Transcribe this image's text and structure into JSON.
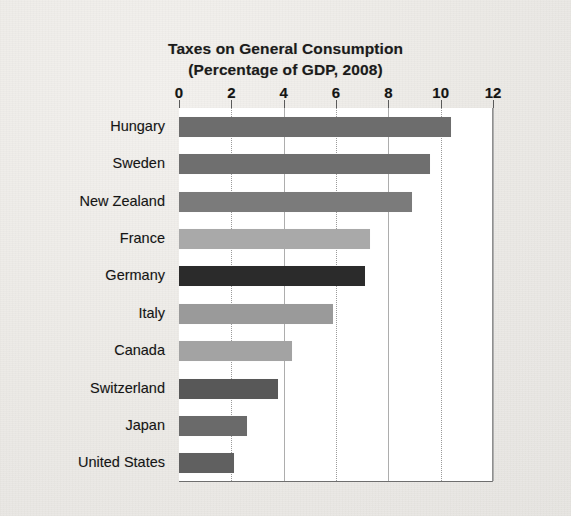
{
  "chart_data": {
    "type": "bar",
    "orientation": "horizontal",
    "title": "Taxes on General Consumption",
    "subtitle": "(Percentage of GDP, 2008)",
    "xlabel": "",
    "ylabel": "",
    "xlim": [
      0,
      12
    ],
    "xticks": [
      0,
      2,
      4,
      6,
      8,
      10,
      12
    ],
    "xtick_labels": [
      "0",
      "2",
      "4",
      "6",
      "8",
      "10",
      "12"
    ],
    "grid": true,
    "grid_axis": "x",
    "legend": false,
    "categories": [
      "Hungary",
      "Sweden",
      "New Zealand",
      "France",
      "Germany",
      "Italy",
      "Canada",
      "Switzerland",
      "Japan",
      "United States"
    ],
    "values": [
      10.4,
      9.6,
      8.9,
      7.3,
      7.1,
      5.9,
      4.3,
      3.8,
      2.6,
      2.1
    ],
    "bar_colors": [
      "#6d6d6d",
      "#6f6f6f",
      "#7b7b7b",
      "#a9a9a9",
      "#2b2b2b",
      "#9a9a9a",
      "#a3a3a3",
      "#585858",
      "#6a6a6a",
      "#606060"
    ]
  },
  "colors": {
    "page_background": "#eeecea",
    "plot_background": "#ffffff",
    "axis_line": "#6e6e6e",
    "gridline": "#9a9a9a",
    "text": "#151515"
  }
}
